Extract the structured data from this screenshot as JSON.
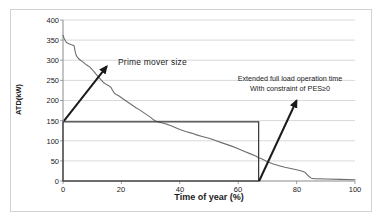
{
  "chart_data": {
    "type": "line",
    "title": "",
    "xlabel": "Time of year (%)",
    "ylabel": "ATD(kW)",
    "xlim": [
      0,
      100
    ],
    "ylim": [
      0,
      400
    ],
    "grid": true,
    "legend": false,
    "xticks": [
      "0",
      "20",
      "40",
      "60",
      "80",
      "100"
    ],
    "yticks": [
      "0",
      "50",
      "100",
      "150",
      "200",
      "250",
      "300",
      "350",
      "400"
    ],
    "series": [
      {
        "name": "Annual thermal demand duration curve",
        "x": [
          0,
          0.5,
          1.2,
          2.0,
          2.6,
          3.2,
          3.8,
          4.2,
          4.6,
          5.2,
          6.0,
          6.8,
          7.6,
          8.4,
          9.2,
          10.0,
          10.8,
          11.6,
          12.4,
          13.2,
          14.0,
          14.8,
          15.6,
          16.4,
          17.0,
          17.6,
          18.4,
          19.2,
          20.0,
          21.0,
          22.0,
          23.0,
          24.0,
          25.0,
          26.0,
          27.0,
          28.0,
          29.0,
          30.0,
          31.0,
          32.0,
          33.0,
          34.0,
          35.0,
          36.0,
          37.0,
          38.0,
          39.0,
          40.0,
          42.0,
          44.0,
          46.0,
          48.0,
          50.0,
          52.0,
          54.0,
          56.0,
          58.0,
          60.0,
          62.0,
          64.0,
          66.0,
          67.0,
          68.0,
          70.0,
          72.0,
          74.0,
          76.0,
          78.0,
          80.0,
          82.0,
          83.0,
          84.0,
          85.0,
          86.0,
          90.0,
          95.0,
          100.0
        ],
        "y": [
          362,
          352,
          344,
          341,
          339,
          338,
          336,
          320,
          311,
          305,
          300,
          296,
          291,
          287,
          283,
          277,
          270,
          263,
          256,
          250,
          244,
          240,
          237,
          233,
          225,
          218,
          214,
          211,
          207,
          202,
          197,
          192,
          187,
          182,
          178,
          173,
          168,
          163,
          158,
          152,
          148,
          146,
          144,
          142,
          140,
          137,
          134,
          131,
          128,
          123,
          119,
          114,
          110,
          106,
          101,
          96,
          91,
          86,
          80,
          74,
          68,
          62,
          58,
          55,
          48,
          42,
          38,
          34,
          31,
          28,
          24,
          21,
          13,
          7,
          6,
          5,
          4,
          3
        ]
      }
    ],
    "annotations": [
      {
        "name": "prime-mover-size",
        "text": "Prime mover size",
        "arrow_from_x": 0,
        "arrow_from_y": 147,
        "arrow_to_x": 15,
        "arrow_to_y": 285
      },
      {
        "name": "extended-full-load",
        "line1": "Extended full load  operation time",
        "line2": "With constraint of PES≥0",
        "arrow_from_x": 67,
        "arrow_from_y": 0,
        "arrow_to_x": 80,
        "arrow_to_y": 200
      }
    ],
    "shapes": [
      {
        "name": "prime-mover-rectangle",
        "type": "rect",
        "x0": 0,
        "y0": 0,
        "x1": 67,
        "y1": 147
      }
    ],
    "colors": {
      "curve": "#6e6e6e",
      "grid": "#c9c9c9",
      "axis": "#7f7f7f",
      "annotation": "#1a1a1a",
      "rectangle": "#333333",
      "frame": "#d2d2d2",
      "background": "#ffffff"
    }
  }
}
